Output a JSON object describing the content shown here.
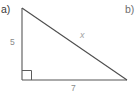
{
  "page": {
    "background_color": "#ffffff",
    "width": 140,
    "height": 99
  },
  "parts": {
    "a_label": "a)",
    "b_label": "b)"
  },
  "figure": {
    "name": "right-triangle",
    "stroke_color": "#555555",
    "right_angle_marker": true,
    "vertices": {
      "top": [
        22,
        8
      ],
      "bottom_left": [
        22,
        80
      ],
      "bottom_right": [
        127,
        80
      ]
    },
    "labels": {
      "vertical_leg": "5",
      "base_leg": "7",
      "hypotenuse": "x"
    },
    "label_color": "#8a8a8a",
    "hypotenuse_label_color": "#a2a2a2"
  }
}
